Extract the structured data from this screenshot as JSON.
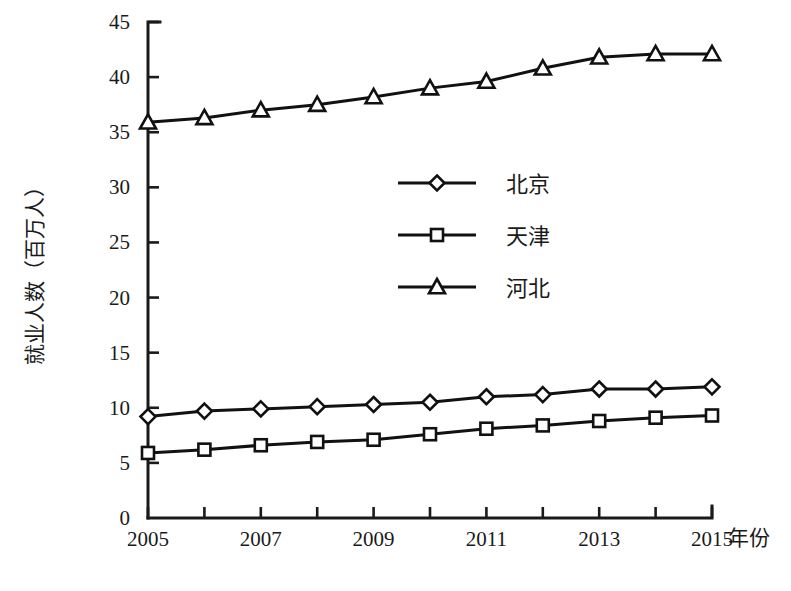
{
  "chart_data": {
    "type": "line",
    "title": "",
    "xlabel": "年份",
    "ylabel": "就业人数（百万人）",
    "x": [
      2005,
      2006,
      2007,
      2008,
      2009,
      2010,
      2011,
      2012,
      2013,
      2014,
      2015
    ],
    "xtick_labels": [
      "2005",
      "2007",
      "2009",
      "2011",
      "2013",
      "2015"
    ],
    "xtick_values": [
      2005,
      2007,
      2009,
      2011,
      2013,
      2015
    ],
    "xlim": [
      2005,
      2015
    ],
    "ylim": [
      0,
      45
    ],
    "ytick_labels": [
      "0",
      "5",
      "10",
      "15",
      "20",
      "25",
      "30",
      "35",
      "40",
      "45"
    ],
    "ytick_values": [
      0,
      5,
      10,
      15,
      20,
      25,
      30,
      35,
      40,
      45
    ],
    "grid": false,
    "legend_position": "center-left-inside",
    "series": [
      {
        "name": "北京",
        "marker": "diamond",
        "color": "#111111",
        "values": [
          9.2,
          9.7,
          9.9,
          10.1,
          10.3,
          10.5,
          11.0,
          11.2,
          11.7,
          11.7,
          11.9
        ]
      },
      {
        "name": "天津",
        "marker": "square",
        "color": "#111111",
        "values": [
          5.9,
          6.2,
          6.6,
          6.9,
          7.1,
          7.6,
          8.1,
          8.4,
          8.8,
          9.1,
          9.3
        ]
      },
      {
        "name": "河北",
        "marker": "triangle",
        "color": "#111111",
        "values": [
          35.9,
          36.3,
          37.0,
          37.5,
          38.2,
          39.0,
          39.6,
          40.8,
          41.8,
          42.1,
          42.1
        ]
      }
    ]
  },
  "legend": {
    "items": [
      {
        "label": "北京",
        "marker": "diamond-icon"
      },
      {
        "label": "天津",
        "marker": "square-icon"
      },
      {
        "label": "河北",
        "marker": "triangle-icon"
      }
    ]
  },
  "axes": {
    "y_title": "就业人数（百万人）",
    "x_title": "年份"
  }
}
